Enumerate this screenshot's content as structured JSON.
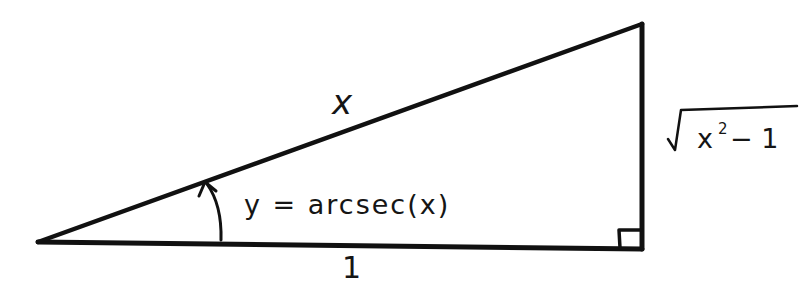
{
  "diagram": {
    "type": "right-triangle",
    "stroke_color": "#111111",
    "background_color": "#ffffff",
    "vertices": {
      "left_acute": [
        38,
        242
      ],
      "right_angle": [
        642,
        248
      ],
      "top": [
        642,
        24
      ]
    },
    "labels": {
      "hypotenuse": "x",
      "adjacent": "1",
      "opposite_radical": "√",
      "opposite_base": "x",
      "opposite_exponent": "2",
      "opposite_rest": "− 1",
      "angle": "y = arcsec(x)"
    }
  }
}
